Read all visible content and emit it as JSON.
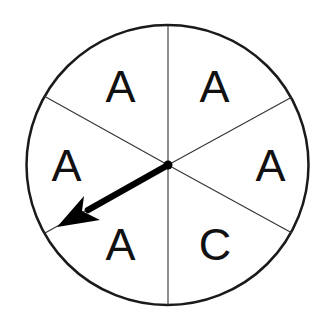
{
  "diagram": {
    "type": "spinner",
    "sector_count": 6,
    "sectors": [
      {
        "label": "A",
        "position": "top-left"
      },
      {
        "label": "A",
        "position": "top-right"
      },
      {
        "label": "A",
        "position": "right"
      },
      {
        "label": "C",
        "position": "bottom-right"
      },
      {
        "label": "A",
        "position": "bottom-left"
      },
      {
        "label": "A",
        "position": "left"
      }
    ],
    "pointer": {
      "description": "arrow from center pointing to lower-left",
      "points_to_boundary_between": [
        "left",
        "bottom-left"
      ]
    },
    "colors": {
      "background": "#ffffff",
      "outline": "#1a1a1a",
      "divider": "#333333",
      "arrow": "#000000",
      "text": "#111111"
    }
  }
}
